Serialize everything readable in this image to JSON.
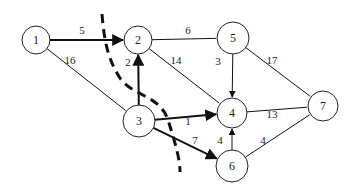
{
  "diagram": {
    "type": "network-flow-graph",
    "nodes": [
      {
        "id": "1",
        "label": "1",
        "x": 36,
        "y": 40,
        "r": 14
      },
      {
        "id": "2",
        "label": "2",
        "x": 138,
        "y": 40,
        "r": 14
      },
      {
        "id": "5",
        "label": "5",
        "x": 233,
        "y": 38,
        "r": 16
      },
      {
        "id": "3",
        "label": "3",
        "x": 139,
        "y": 121,
        "r": 16
      },
      {
        "id": "4",
        "label": "4",
        "x": 232,
        "y": 113,
        "r": 15
      },
      {
        "id": "7",
        "label": "7",
        "x": 323,
        "y": 106,
        "r": 15
      },
      {
        "id": "6",
        "label": "6",
        "x": 232,
        "y": 166,
        "r": 16
      }
    ],
    "edges": [
      {
        "from": "1",
        "to": "2",
        "weight": "5",
        "directed": true,
        "bold": true,
        "lx": 82,
        "ly": 34
      },
      {
        "from": "1",
        "to": "3",
        "weight": "16",
        "directed": false,
        "bold": false,
        "lx": 70,
        "ly": 64
      },
      {
        "from": "3",
        "to": "2",
        "weight": "2",
        "directed": true,
        "bold": true,
        "lx": 128,
        "ly": 66
      },
      {
        "from": "2",
        "to": "5",
        "weight": "6",
        "directed": false,
        "bold": false,
        "lx": 188,
        "ly": 34
      },
      {
        "from": "2",
        "to": "4",
        "weight": "14",
        "directed": false,
        "bold": false,
        "lx": 176,
        "ly": 64
      },
      {
        "from": "5",
        "to": "4",
        "weight": "3",
        "directed": true,
        "bold": false,
        "lx": 218,
        "ly": 65
      },
      {
        "from": "5",
        "to": "7",
        "weight": "17",
        "directed": false,
        "bold": false,
        "lx": 272,
        "ly": 64
      },
      {
        "from": "3",
        "to": "4",
        "weight": "1",
        "directed": true,
        "bold": true,
        "lx": 188,
        "ly": 125
      },
      {
        "from": "3",
        "to": "6",
        "weight": "7",
        "directed": true,
        "bold": true,
        "lx": 195,
        "ly": 144
      },
      {
        "from": "4",
        "to": "7",
        "weight": "13",
        "directed": false,
        "bold": false,
        "lx": 272,
        "ly": 118
      },
      {
        "from": "6",
        "to": "4",
        "weight": "4",
        "directed": true,
        "bold": false,
        "lx": 220,
        "ly": 144
      },
      {
        "from": "6",
        "to": "7",
        "weight": "4",
        "directed": false,
        "bold": false,
        "lx": 263,
        "ly": 144
      }
    ],
    "cut_line": {
      "style": "dashed",
      "path": "M 102 14 C 104 40, 108 60, 120 78 S 160 95, 168 120 S 180 160, 180 172"
    }
  }
}
